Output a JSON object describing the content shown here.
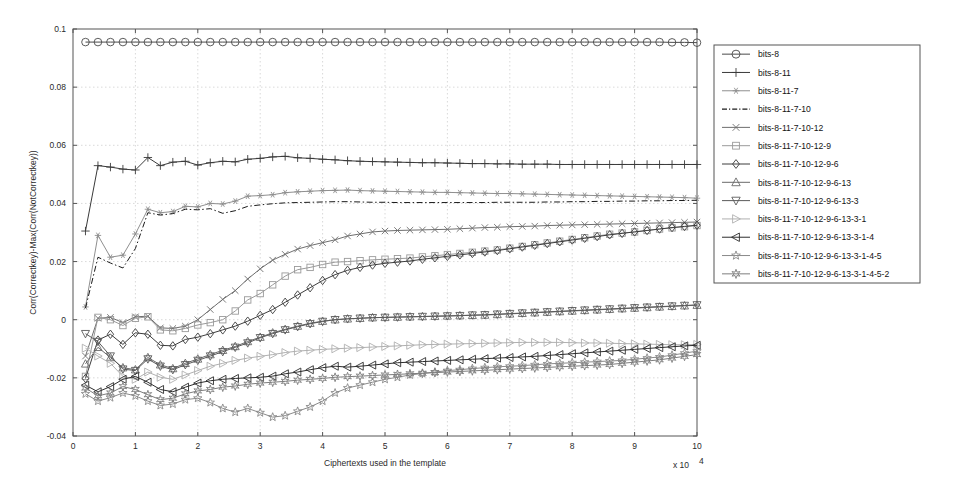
{
  "chart_data": {
    "type": "line",
    "title": "",
    "xlabel": "Ciphertexts used in the template",
    "ylabel": "Corr(Correctkey)-Max(Corr(NotCorrectkey))",
    "x_exponent_label": "x 10",
    "x_exponent_sup": "4",
    "xlim": [
      0,
      10
    ],
    "ylim": [
      -0.04,
      0.1
    ],
    "xticks": [
      0,
      1,
      2,
      3,
      4,
      5,
      6,
      7,
      8,
      9,
      10
    ],
    "xticklabels": [
      "0",
      "1",
      "2",
      "3",
      "4",
      "5",
      "6",
      "7",
      "8",
      "9",
      "10"
    ],
    "yticks": [
      -0.04,
      -0.02,
      0,
      0.02,
      0.04,
      0.06,
      0.08,
      0.1
    ],
    "yticklabels": [
      "-0.04",
      "-0.02",
      "0",
      "0.02",
      "0.04",
      "0.06",
      "0.08",
      "0.1"
    ],
    "grid": true,
    "legend_position": "right-outside",
    "x": [
      0.2,
      0.4,
      0.6,
      0.8,
      1.0,
      1.2,
      1.4,
      1.6,
      1.8,
      2.0,
      2.2,
      2.4,
      2.6,
      2.8,
      3.0,
      3.2,
      3.4,
      3.6,
      3.8,
      4.0,
      4.2,
      4.4,
      4.6,
      4.8,
      5.0,
      5.2,
      5.4,
      5.6,
      5.8,
      6.0,
      6.2,
      6.4,
      6.6,
      6.8,
      7.0,
      7.2,
      7.4,
      7.6,
      7.8,
      8.0,
      8.2,
      8.4,
      8.6,
      8.8,
      9.0,
      9.2,
      9.4,
      9.6,
      9.8,
      10.0
    ],
    "series": [
      {
        "name": "bits-8",
        "marker": "circle",
        "line": "solid",
        "color": "#4a4a4a",
        "values": [
          0.0955,
          0.0955,
          0.0955,
          0.0955,
          0.0955,
          0.0955,
          0.0955,
          0.0955,
          0.0955,
          0.0955,
          0.0955,
          0.0955,
          0.0955,
          0.0955,
          0.0955,
          0.0955,
          0.0955,
          0.0955,
          0.0955,
          0.0955,
          0.0955,
          0.0955,
          0.0955,
          0.0955,
          0.0955,
          0.0955,
          0.0955,
          0.0955,
          0.0955,
          0.0955,
          0.0955,
          0.0955,
          0.0955,
          0.0955,
          0.0955,
          0.0955,
          0.0955,
          0.0955,
          0.0955,
          0.0955,
          0.0955,
          0.0955,
          0.0955,
          0.0955,
          0.0955,
          0.0955,
          0.0955,
          0.0954,
          0.0954,
          0.0953
        ]
      },
      {
        "name": "bits-8-11",
        "marker": "plus",
        "line": "solid",
        "color": "#3a3a3a",
        "values": [
          0.0305,
          0.053,
          0.0525,
          0.0518,
          0.0515,
          0.0558,
          0.053,
          0.0542,
          0.0545,
          0.0532,
          0.054,
          0.0545,
          0.0543,
          0.0552,
          0.0555,
          0.056,
          0.0562,
          0.0557,
          0.0555,
          0.0552,
          0.055,
          0.0547,
          0.0545,
          0.0544,
          0.0543,
          0.0542,
          0.0541,
          0.054,
          0.054,
          0.0539,
          0.0538,
          0.0537,
          0.0537,
          0.0536,
          0.0536,
          0.0535,
          0.0535,
          0.0535,
          0.0534,
          0.0534,
          0.0534,
          0.0534,
          0.0534,
          0.0534,
          0.0534,
          0.0534,
          0.0534,
          0.0534,
          0.0534,
          0.0534
        ]
      },
      {
        "name": "bits-8-11-7",
        "marker": "asterisk",
        "line": "solid",
        "color": "#8f8f8f",
        "values": [
          0.0044,
          0.029,
          0.0215,
          0.0222,
          0.0295,
          0.038,
          0.0368,
          0.0372,
          0.039,
          0.0388,
          0.04,
          0.0398,
          0.0408,
          0.0425,
          0.0427,
          0.043,
          0.0437,
          0.044,
          0.0442,
          0.0444,
          0.0445,
          0.0446,
          0.0444,
          0.0443,
          0.0442,
          0.0441,
          0.044,
          0.0439,
          0.0438,
          0.0438,
          0.0437,
          0.0436,
          0.0435,
          0.0434,
          0.0434,
          0.0433,
          0.0432,
          0.0431,
          0.043,
          0.0429,
          0.0428,
          0.0427,
          0.0426,
          0.0425,
          0.0424,
          0.0423,
          0.0422,
          0.0421,
          0.042,
          0.0418
        ]
      },
      {
        "name": "bits-8-11-7-10",
        "marker": "none",
        "line": "dashdot",
        "color": "#1a1a1a",
        "values": [
          0.004,
          0.0215,
          0.0195,
          0.0178,
          0.0245,
          0.0368,
          0.036,
          0.0365,
          0.038,
          0.0378,
          0.0382,
          0.0366,
          0.0375,
          0.039,
          0.0395,
          0.0399,
          0.0402,
          0.0403,
          0.0404,
          0.0405,
          0.0406,
          0.0406,
          0.0405,
          0.0404,
          0.0404,
          0.0403,
          0.0403,
          0.0403,
          0.0403,
          0.0403,
          0.0403,
          0.0403,
          0.0403,
          0.0404,
          0.0404,
          0.0404,
          0.0404,
          0.0405,
          0.0405,
          0.0406,
          0.0406,
          0.0407,
          0.0407,
          0.0408,
          0.0408,
          0.0409,
          0.0409,
          0.041,
          0.041,
          0.0411
        ]
      },
      {
        "name": "bits-8-11-7-10-12",
        "marker": "xcross",
        "line": "solid",
        "color": "#6e6e6e",
        "values": [
          -0.0125,
          0.0005,
          0.0008,
          -0.001,
          0.001,
          0.0012,
          -0.0028,
          -0.003,
          -0.0022,
          0.0,
          0.0035,
          0.007,
          0.01,
          0.014,
          0.0175,
          0.0205,
          0.0225,
          0.0243,
          0.0255,
          0.0265,
          0.0275,
          0.0288,
          0.0295,
          0.0302,
          0.0305,
          0.0307,
          0.0308,
          0.0309,
          0.031,
          0.0311,
          0.0313,
          0.0315,
          0.0317,
          0.0318,
          0.032,
          0.0321,
          0.0322,
          0.0324,
          0.0325,
          0.0326,
          0.0327,
          0.0328,
          0.0329,
          0.033,
          0.0331,
          0.0332,
          0.0333,
          0.0334,
          0.0335,
          0.0336
        ]
      },
      {
        "name": "bits-8-11-7-10-12-9",
        "marker": "square",
        "line": "solid",
        "color": "#9a9a9a",
        "values": [
          -0.0195,
          0.0008,
          0.0,
          -0.002,
          0.0005,
          0.001,
          -0.0035,
          -0.0038,
          -0.003,
          -0.0018,
          -0.001,
          0.0,
          0.003,
          0.0068,
          0.009,
          0.012,
          0.015,
          0.0172,
          0.018,
          0.019,
          0.0198,
          0.02,
          0.0203,
          0.0206,
          0.0208,
          0.021,
          0.0212,
          0.0216,
          0.022,
          0.0224,
          0.0228,
          0.0232,
          0.0236,
          0.024,
          0.0246,
          0.0252,
          0.0258,
          0.0264,
          0.027,
          0.0276,
          0.0282,
          0.0288,
          0.0294,
          0.0298,
          0.0302,
          0.0307,
          0.0312,
          0.0316,
          0.032,
          0.0324
        ]
      },
      {
        "name": "bits-8-11-7-10-12-9-6",
        "marker": "diamond",
        "line": "solid",
        "color": "#3d3d3d",
        "values": [
          -0.0202,
          -0.007,
          -0.005,
          -0.0085,
          -0.0045,
          -0.005,
          -0.0088,
          -0.009,
          -0.0068,
          -0.006,
          -0.0048,
          -0.0035,
          -0.0022,
          -0.0005,
          0.0015,
          0.0035,
          0.006,
          0.0085,
          0.011,
          0.0135,
          0.0155,
          0.017,
          0.018,
          0.0188,
          0.0194,
          0.0198,
          0.0202,
          0.0208,
          0.0213,
          0.0218,
          0.0223,
          0.0228,
          0.0233,
          0.0238,
          0.0244,
          0.025,
          0.0256,
          0.0262,
          0.0268,
          0.0274,
          0.028,
          0.0286,
          0.0292,
          0.0297,
          0.0302,
          0.0307,
          0.0312,
          0.0317,
          0.0321,
          0.0325
        ]
      },
      {
        "name": "bits-8-11-7-10-12-9-6-13",
        "marker": "tri-up",
        "line": "solid",
        "color": "#6a6a6a",
        "values": [
          -0.0152,
          -0.0095,
          -0.013,
          -0.0165,
          -0.0172,
          -0.013,
          -0.0155,
          -0.0168,
          -0.015,
          -0.0135,
          -0.012,
          -0.0105,
          -0.0092,
          -0.0075,
          -0.006,
          -0.0045,
          -0.0033,
          -0.0022,
          -0.0012,
          -0.0005,
          0.0,
          0.0003,
          0.0005,
          0.0007,
          0.0008,
          0.0009,
          0.001,
          0.0011,
          0.0012,
          0.0013,
          0.0014,
          0.0015,
          0.0016,
          0.0018,
          0.002,
          0.0022,
          0.0024,
          0.0026,
          0.0028,
          0.003,
          0.0032,
          0.0034,
          0.0036,
          0.0038,
          0.004,
          0.0042,
          0.0044,
          0.0046,
          0.0048,
          0.005
        ]
      },
      {
        "name": "bits-8-11-7-10-12-9-6-13-3",
        "marker": "tri-down",
        "line": "solid",
        "color": "#5a5a5a",
        "values": [
          -0.0048,
          -0.0075,
          -0.0125,
          -0.017,
          -0.0175,
          -0.0135,
          -0.016,
          -0.0172,
          -0.0155,
          -0.014,
          -0.0125,
          -0.011,
          -0.0095,
          -0.008,
          -0.0062,
          -0.0048,
          -0.0035,
          -0.0024,
          -0.0014,
          -0.0006,
          0.0,
          0.0003,
          0.0005,
          0.0007,
          0.0008,
          0.0009,
          0.001,
          0.0011,
          0.0012,
          0.0013,
          0.0014,
          0.0016,
          0.0017,
          0.0019,
          0.0021,
          0.0023,
          0.0025,
          0.0027,
          0.0029,
          0.0031,
          0.0033,
          0.0035,
          0.0037,
          0.0039,
          0.0041,
          0.0043,
          0.0045,
          0.0047,
          0.0049,
          0.0051
        ]
      },
      {
        "name": "bits-8-11-7-10-12-9-6-13-3-1",
        "marker": "tri-right",
        "line": "solid",
        "color": "#b0b0b0",
        "values": [
          -0.0098,
          -0.0125,
          -0.015,
          -0.0195,
          -0.0205,
          -0.018,
          -0.0198,
          -0.0205,
          -0.019,
          -0.0175,
          -0.016,
          -0.015,
          -0.014,
          -0.0132,
          -0.0126,
          -0.012,
          -0.0113,
          -0.0108,
          -0.0105,
          -0.0102,
          -0.01,
          -0.0098,
          -0.0096,
          -0.0094,
          -0.0092,
          -0.009,
          -0.0088,
          -0.0086,
          -0.0085,
          -0.0084,
          -0.0083,
          -0.0082,
          -0.0081,
          -0.008,
          -0.0079,
          -0.0078,
          -0.0078,
          -0.0078,
          -0.0078,
          -0.0079,
          -0.008,
          -0.008,
          -0.0081,
          -0.0082,
          -0.0083,
          -0.0084,
          -0.0085,
          -0.0086,
          -0.0086,
          -0.0085
        ]
      },
      {
        "name": "bits-8-11-7-10-12-9-6-13-3-1-4",
        "marker": "tri-left",
        "line": "solid",
        "color": "#2e2e2e",
        "values": [
          -0.0225,
          -0.0248,
          -0.023,
          -0.0205,
          -0.0195,
          -0.0215,
          -0.024,
          -0.0248,
          -0.0232,
          -0.0218,
          -0.021,
          -0.0205,
          -0.0202,
          -0.02,
          -0.0198,
          -0.0194,
          -0.0186,
          -0.018,
          -0.0172,
          -0.0165,
          -0.016,
          -0.0163,
          -0.016,
          -0.0156,
          -0.0152,
          -0.0148,
          -0.0146,
          -0.0144,
          -0.0142,
          -0.014,
          -0.0138,
          -0.0136,
          -0.0134,
          -0.0132,
          -0.013,
          -0.0128,
          -0.0126,
          -0.0123,
          -0.012,
          -0.0117,
          -0.0114,
          -0.0111,
          -0.0108,
          -0.0105,
          -0.0102,
          -0.0099,
          -0.0096,
          -0.0093,
          -0.009,
          -0.0088
        ]
      },
      {
        "name": "bits-8-11-7-10-12-9-6-13-3-1-4-5",
        "marker": "star5",
        "line": "solid",
        "color": "#8a8a8a",
        "values": [
          -0.0255,
          -0.028,
          -0.0268,
          -0.0252,
          -0.0262,
          -0.028,
          -0.0295,
          -0.029,
          -0.0275,
          -0.027,
          -0.0285,
          -0.0305,
          -0.0318,
          -0.0305,
          -0.032,
          -0.0335,
          -0.033,
          -0.0315,
          -0.03,
          -0.028,
          -0.0252,
          -0.0235,
          -0.0225,
          -0.0215,
          -0.0205,
          -0.0198,
          -0.019,
          -0.0185,
          -0.018,
          -0.0175,
          -0.0172,
          -0.0168,
          -0.0165,
          -0.0162,
          -0.016,
          -0.0158,
          -0.0155,
          -0.0152,
          -0.015,
          -0.0148,
          -0.0146,
          -0.0144,
          -0.0142,
          -0.014,
          -0.0136,
          -0.0132,
          -0.0128,
          -0.0122,
          -0.0115,
          -0.0108
        ]
      },
      {
        "name": "bits-8-11-7-10-12-9-6-13-3-1-4-5-2",
        "marker": "star6",
        "line": "solid",
        "color": "#7d7d7d",
        "values": [
          -0.0235,
          -0.0262,
          -0.0252,
          -0.023,
          -0.024,
          -0.0258,
          -0.0275,
          -0.027,
          -0.0255,
          -0.0245,
          -0.024,
          -0.0232,
          -0.0228,
          -0.0222,
          -0.0218,
          -0.0215,
          -0.0212,
          -0.0208,
          -0.0205,
          -0.0202,
          -0.0198,
          -0.0196,
          -0.0194,
          -0.0192,
          -0.019,
          -0.0188,
          -0.0186,
          -0.0184,
          -0.0182,
          -0.018,
          -0.0178,
          -0.0176,
          -0.0174,
          -0.0172,
          -0.017,
          -0.0168,
          -0.0166,
          -0.0164,
          -0.0162,
          -0.016,
          -0.0158,
          -0.0156,
          -0.0154,
          -0.015,
          -0.0146,
          -0.0142,
          -0.0138,
          -0.0132,
          -0.0126,
          -0.012
        ]
      }
    ]
  },
  "legend": {
    "items": [
      "bits-8",
      "bits-8-11",
      "bits-8-11-7",
      "bits-8-11-7-10",
      "bits-8-11-7-10-12",
      "bits-8-11-7-10-12-9",
      "bits-8-11-7-10-12-9-6",
      "bits-8-11-7-10-12-9-6-13",
      "bits-8-11-7-10-12-9-6-13-3",
      "bits-8-11-7-10-12-9-6-13-3-1",
      "bits-8-11-7-10-12-9-6-13-3-1-4",
      "bits-8-11-7-10-12-9-6-13-3-1-4-5",
      "bits-8-11-7-10-12-9-6-13-3-1-4-5-2"
    ]
  }
}
